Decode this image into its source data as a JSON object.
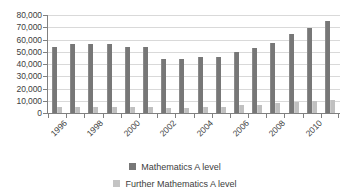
{
  "chart_data": {
    "type": "bar",
    "title": "",
    "xlabel": "",
    "ylabel": "",
    "ylim": [
      0,
      80000
    ],
    "ytick_step": 10000,
    "grid": true,
    "legend_position": "bottom",
    "categories": [
      "1996",
      "1997",
      "1998",
      "1999",
      "2000",
      "2001",
      "2002",
      "2003",
      "2004",
      "2005",
      "2006",
      "2007",
      "2008",
      "2009",
      "2010",
      "2011"
    ],
    "visible_tick_labels": [
      "1996",
      "1998",
      "2000",
      "2002",
      "2004",
      "2006",
      "2008",
      "2010"
    ],
    "ytick_labels": [
      "80,000",
      "70,000",
      "60,000",
      "50,000",
      "40,000",
      "30,000",
      "20,000",
      "10,000",
      "0"
    ],
    "ytick_values": [
      80000,
      70000,
      60000,
      50000,
      40000,
      30000,
      20000,
      10000,
      0
    ],
    "series": [
      {
        "name": "Mathematics A level",
        "color": "#777777",
        "values": [
          54000,
          56000,
          56500,
          56000,
          53500,
          54000,
          43800,
          44200,
          45800,
          46000,
          49500,
          53000,
          57500,
          64500,
          69500,
          75000
        ]
      },
      {
        "name": "Further Mathematics A level",
        "color": "#c0c0c0",
        "values": [
          4900,
          4800,
          5200,
          4800,
          4700,
          4900,
          4200,
          4400,
          4800,
          4800,
          6300,
          6800,
          8000,
          9200,
          10000,
          10800
        ]
      }
    ]
  },
  "legend": {
    "items": [
      {
        "label": "Mathematics A level",
        "swatch": "#777777"
      },
      {
        "label": "Further Mathematics A level",
        "swatch": "#c4c4c4"
      }
    ]
  }
}
